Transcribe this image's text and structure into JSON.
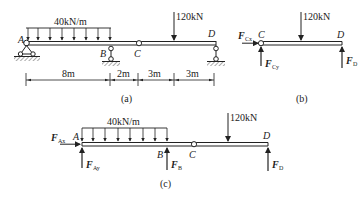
{
  "figures": {
    "a": {
      "caption": "(a)",
      "distributed_load": "40kN/m",
      "point_load": "120kN",
      "points": {
        "A": "A",
        "B": "B",
        "C": "C",
        "D": "D"
      },
      "dimensions": [
        "8m",
        "2m",
        "3m",
        "3m"
      ]
    },
    "b": {
      "caption": "(b)",
      "point_load": "120kN",
      "points": {
        "C": "C",
        "D": "D"
      },
      "forces": {
        "Cx_main": "F",
        "Cx_sub": "Cx",
        "Cy_main": "F",
        "Cy_sub": "Cy",
        "D_main": "F",
        "D_sub": "D"
      }
    },
    "c": {
      "caption": "(c)",
      "distributed_load": "40kN/m",
      "point_load": "120kN",
      "points": {
        "A": "A",
        "B": "B",
        "C": "C",
        "D": "D"
      },
      "forces": {
        "Ax_main": "F",
        "Ax_sub": "Ax",
        "Ay_main": "F",
        "Ay_sub": "Ay",
        "B_main": "F",
        "B_sub": "B",
        "D_main": "F",
        "D_sub": "D"
      }
    }
  },
  "colors": {
    "ink": "#222222",
    "hatch": "#555555",
    "background": "#ffffff"
  }
}
